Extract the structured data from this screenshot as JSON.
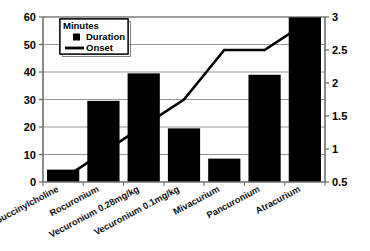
{
  "chart_data": {
    "type": "bar",
    "title": "",
    "subtitle": "",
    "xlabel": "",
    "ylabel": "",
    "y2label": "",
    "grid": true,
    "legend_position": "top-left",
    "legend_title": "Minutes",
    "categories": [
      "Succinylcholine",
      "Rocuronium",
      "Vecuronium 0.28mg/kg",
      "Vecuronium 0.1mg/kg",
      "Mivacurium",
      "Pancuronium",
      "Atracurium"
    ],
    "series": [
      {
        "name": "Duration",
        "type": "bar",
        "axis": "left",
        "values": [
          4.5,
          29.5,
          39.5,
          19.5,
          8.5,
          39,
          60
        ]
      },
      {
        "name": "Onset",
        "type": "line",
        "axis": "right",
        "values": [
          0.55,
          0.95,
          1.35,
          1.75,
          2.5,
          2.5,
          2.9
        ]
      }
    ],
    "ylim": [
      0,
      60
    ],
    "yticks": [
      "0",
      "10",
      "20",
      "30",
      "40",
      "50",
      "60"
    ],
    "y2lim": [
      0.5,
      3
    ],
    "y2ticks": [
      "0.5",
      "1",
      "1.5",
      "2",
      "2.5",
      "3"
    ],
    "colors": {
      "bar": "#000000",
      "line": "#000000",
      "grid": "#8a8a8a",
      "axis": "#6f6f6f",
      "background": "#ffffff"
    }
  },
  "legend": {
    "title": "Minutes",
    "entries": [
      {
        "label": "Duration",
        "marker": "square-marker"
      },
      {
        "label": "Onset",
        "marker": "line-marker"
      }
    ]
  }
}
